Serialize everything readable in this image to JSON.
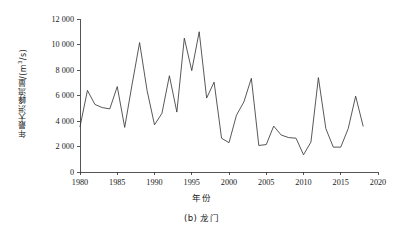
{
  "figure": {
    "caption": "(b) 龙门",
    "caption_label": "(b)",
    "caption_station": "龙门"
  },
  "axis": {
    "y_title_main": "年最大洪峰流量/(m",
    "y_title_sup": "3",
    "y_title_tail": "/s)",
    "x_title": "年份"
  },
  "chart_data": {
    "type": "line",
    "title": "",
    "subtitle": "",
    "xlabel": "年份",
    "ylabel": "年最大洪峰流量/(m³/s)",
    "xlim": [
      1980,
      2020
    ],
    "ylim": [
      0,
      12000
    ],
    "xticks": [
      1980,
      1985,
      1990,
      1995,
      2000,
      2005,
      2010,
      2015,
      2020
    ],
    "yticks": [
      0,
      2000,
      4000,
      6000,
      8000,
      10000,
      12000
    ],
    "xtick_labels": [
      "1980",
      "1985",
      "1990",
      "1995",
      "2000",
      "2005",
      "2010",
      "2015",
      "2020"
    ],
    "ytick_labels": [
      "0",
      "2 000",
      "4 000",
      "6 000",
      "8 000",
      "10 000",
      "12 000"
    ],
    "grid": false,
    "legend": null,
    "legend_position": "none",
    "line_color": "#3a3a3a",
    "x": [
      1980,
      1981,
      1982,
      1983,
      1984,
      1985,
      1986,
      1987,
      1988,
      1989,
      1990,
      1991,
      1992,
      1993,
      1994,
      1995,
      1996,
      1997,
      1998,
      1999,
      2000,
      2001,
      2002,
      2003,
      2004,
      2005,
      2006,
      2007,
      2008,
      2009,
      2010,
      2011,
      2012,
      2013,
      2014,
      2015,
      2016,
      2017,
      2018
    ],
    "values": [
      3550,
      6400,
      5300,
      5050,
      4950,
      6700,
      3500,
      6900,
      10150,
      6400,
      3700,
      4600,
      7550,
      4700,
      10500,
      7950,
      11000,
      5800,
      7050,
      2650,
      2300,
      4450,
      5500,
      7350,
      2080,
      2150,
      3600,
      2900,
      2700,
      2650,
      1350,
      2350,
      7400,
      3400,
      1950,
      1950,
      3400,
      5950,
      3600
    ],
    "series": [
      {
        "name": "年最大洪峰流量",
        "values": [
          3550,
          6400,
          5300,
          5050,
          4950,
          6700,
          3500,
          6900,
          10150,
          6400,
          3700,
          4600,
          7550,
          4700,
          10500,
          7950,
          11000,
          5800,
          7050,
          2650,
          2300,
          4450,
          5500,
          7350,
          2080,
          2150,
          3600,
          2900,
          2700,
          2650,
          1350,
          2350,
          7400,
          3400,
          1950,
          1950,
          3400,
          5950,
          3600
        ]
      }
    ],
    "units": "m³/s",
    "station": "龙门",
    "max_value": 11000,
    "max_year": 1996,
    "min_value": 1350,
    "min_year": 2010
  }
}
